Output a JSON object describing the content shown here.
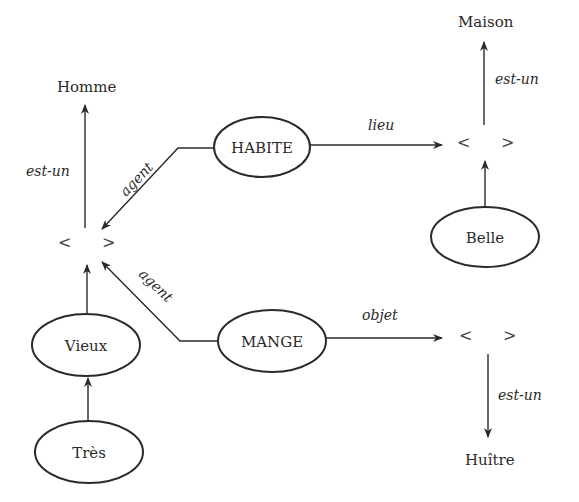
{
  "diagram": {
    "type": "semantic-network",
    "nodes": {
      "homme": "Homme",
      "maison": "Maison",
      "huitre": "Huître",
      "habite": "HABITE",
      "mange": "MANGE",
      "belle": "Belle",
      "vieux": "Vieux",
      "tres": "Très",
      "slot_open": "<",
      "slot_close": ">"
    },
    "edges": {
      "est_un": "est-un",
      "agent": "agent",
      "lieu": "lieu",
      "objet": "objet"
    },
    "relations": [
      {
        "from": "slot-left",
        "to": "Homme",
        "label": "est-un"
      },
      {
        "from": "HABITE",
        "to": "slot-left",
        "label": "agent"
      },
      {
        "from": "MANGE",
        "to": "slot-left",
        "label": "agent"
      },
      {
        "from": "HABITE",
        "to": "slot-top-right",
        "label": "lieu"
      },
      {
        "from": "slot-top-right",
        "to": "Maison",
        "label": "est-un"
      },
      {
        "from": "Belle",
        "to": "slot-top-right",
        "label": ""
      },
      {
        "from": "MANGE",
        "to": "slot-bottom-right",
        "label": "objet"
      },
      {
        "from": "slot-bottom-right",
        "to": "Huître",
        "label": "est-un"
      },
      {
        "from": "Vieux",
        "to": "slot-left",
        "label": ""
      },
      {
        "from": "Très",
        "to": "Vieux",
        "label": ""
      }
    ]
  }
}
